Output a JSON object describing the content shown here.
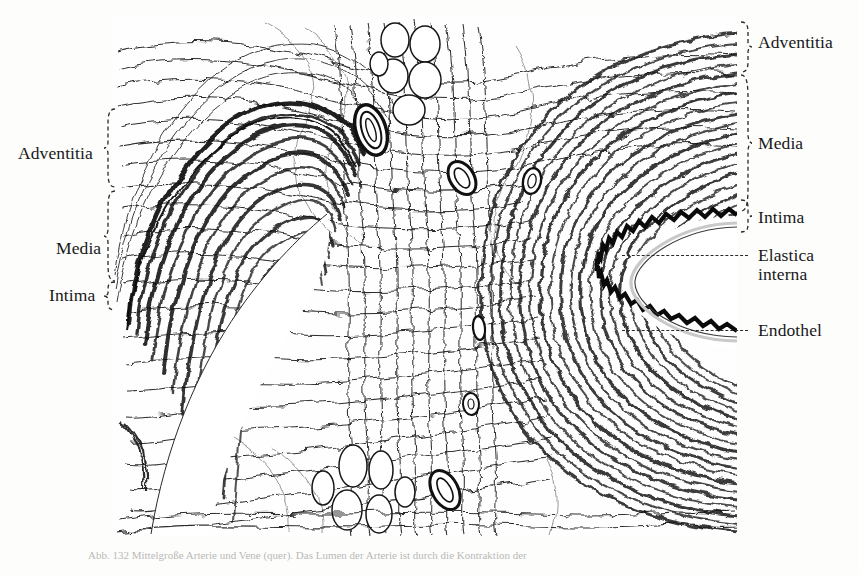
{
  "figure": {
    "caption": "Abb. 132   Mittelgroße Arterie und Vene (quer). Das Lumen der Arterie ist durch die Kontraktion der"
  },
  "labels_left": [
    {
      "id": "adventitia",
      "text": "Adventitia",
      "x": 18,
      "y": 144
    },
    {
      "id": "media",
      "text": "Media",
      "x": 56,
      "y": 239
    },
    {
      "id": "intima",
      "text": "Intima",
      "x": 49,
      "y": 286
    }
  ],
  "labels_right": [
    {
      "id": "adventitia",
      "text": "Adventitia",
      "x": 758,
      "y": 33
    },
    {
      "id": "media",
      "text": "Media",
      "x": 758,
      "y": 134
    },
    {
      "id": "intima",
      "text": "Intima",
      "x": 758,
      "y": 208
    },
    {
      "id": "elastica-interna-line1",
      "text": "Elastica",
      "x": 758,
      "y": 248
    },
    {
      "id": "elastica-interna-line2",
      "text": "interna",
      "x": 758,
      "y": 267
    },
    {
      "id": "endothel",
      "text": "Endothel",
      "x": 758,
      "y": 322
    }
  ],
  "leaders": [
    {
      "id": "elastica-interna-leader",
      "x": 622,
      "y": 255,
      "width": 126
    },
    {
      "id": "endothel-leader",
      "x": 622,
      "y": 330,
      "width": 126
    }
  ],
  "braces_left": [
    {
      "id": "adventitia-brace",
      "x": 103,
      "y": 108,
      "height": 80,
      "labelY": 152
    },
    {
      "id": "media-brace",
      "x": 103,
      "y": 190,
      "height": 90,
      "labelY": 247
    },
    {
      "id": "intima-brace",
      "x": 103,
      "y": 281,
      "height": 30,
      "labelY": 294
    }
  ],
  "braces_right": [
    {
      "id": "adventitia-brace",
      "x": 742,
      "y": 22,
      "height": 50,
      "labelY": 41
    },
    {
      "id": "media-brace",
      "x": 742,
      "y": 75,
      "height": 136,
      "labelY": 142
    },
    {
      "id": "intima-brace",
      "x": 742,
      "y": 200,
      "height": 32,
      "labelY": 216
    }
  ],
  "structures": {
    "artery_lumen": "white crescent cavity right of center",
    "vein_lumen": "white cavity left of center",
    "elastica_interna": "thick wavy black band lining artery lumen",
    "adipose_cells": "clusters of oval fat cells in center",
    "vasa_vasorum": "small vessel profiles scattered in adventitia"
  },
  "colors": {
    "background": "#fdfdfc",
    "ink": "#141414",
    "label_text": "#18181a",
    "brace_line": "#2a2a2a",
    "caption_text": "#b9b9b6"
  }
}
